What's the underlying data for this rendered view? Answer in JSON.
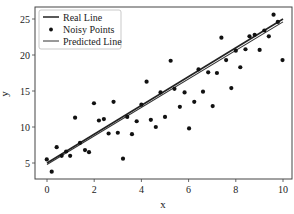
{
  "chart_data": {
    "type": "scatter",
    "title": "",
    "xlabel": "x",
    "ylabel": "y",
    "xlim": [
      -0.5,
      10.3
    ],
    "ylim": [
      2.8,
      26.2
    ],
    "xticks": [
      0,
      2,
      4,
      6,
      8,
      10
    ],
    "yticks": [
      5,
      10,
      15,
      20,
      25
    ],
    "grid": false,
    "legend_position": "upper left",
    "legend": [
      "Real Line",
      "Noisy Points",
      "Predicted Line"
    ],
    "series": [
      {
        "name": "Real Line",
        "kind": "line",
        "color": "#222222",
        "x": [
          0,
          10
        ],
        "y": [
          5.0,
          25.0
        ]
      },
      {
        "name": "Noisy Points",
        "kind": "scatter",
        "color": "#111111",
        "x": [
          -0.01,
          0.2,
          0.41,
          0.62,
          0.81,
          0.98,
          1.19,
          1.4,
          1.61,
          1.78,
          1.99,
          2.2,
          2.41,
          2.61,
          2.82,
          3.0,
          3.22,
          3.4,
          3.6,
          3.8,
          4.0,
          4.22,
          4.4,
          4.61,
          4.81,
          5.0,
          5.24,
          5.4,
          5.63,
          5.83,
          6.02,
          6.24,
          6.42,
          6.61,
          6.83,
          7.02,
          7.2,
          7.39,
          7.59,
          7.81,
          8.0,
          8.19,
          8.41,
          8.58,
          8.8,
          9.01,
          9.21,
          9.4,
          9.6,
          9.78,
          9.98
        ],
        "y": [
          5.5,
          3.8,
          7.2,
          6.0,
          6.6,
          6.0,
          11.3,
          7.8,
          6.8,
          6.5,
          13.3,
          10.9,
          11.1,
          9.1,
          13.5,
          9.2,
          5.6,
          11.4,
          9.0,
          10.8,
          13.1,
          16.3,
          11.0,
          10.0,
          14.8,
          11.4,
          19.2,
          15.3,
          12.8,
          14.8,
          9.8,
          13.5,
          18.0,
          14.9,
          17.6,
          12.9,
          17.5,
          22.4,
          19.3,
          15.4,
          20.6,
          18.3,
          20.8,
          22.6,
          22.8,
          20.7,
          23.4,
          22.6,
          25.6,
          24.6,
          19.3
        ]
      },
      {
        "name": "Predicted Line",
        "kind": "line",
        "color": "#333333",
        "x": [
          0,
          10
        ],
        "y": [
          4.8,
          24.6
        ]
      }
    ]
  }
}
